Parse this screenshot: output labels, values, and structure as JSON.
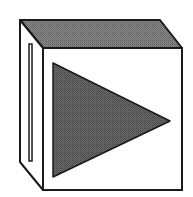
{
  "icon": {
    "name": "media-player-play-cube",
    "colors": {
      "background": "#ffffff",
      "outline": "#1a1a1a",
      "top_face": "#7a7a7a",
      "triangle": "#5a5a5a",
      "front_face": "#ffffff",
      "side_face": "#ffffff"
    }
  }
}
